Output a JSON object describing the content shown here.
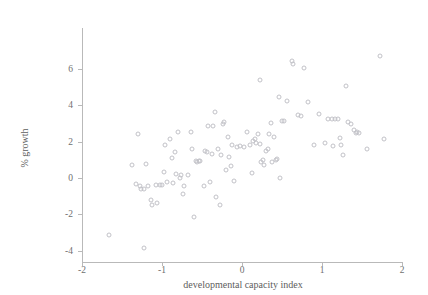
{
  "chart_data": {
    "type": "scatter",
    "title": "",
    "xlabel": "developmental capacity index",
    "ylabel": "% growth",
    "xlim": [
      -2,
      2
    ],
    "ylim": [
      -4.4,
      7.0
    ],
    "xticks": [
      -2,
      -1,
      0,
      1,
      2
    ],
    "xtick_labels": [
      "-2",
      "-1",
      "0",
      "1",
      "2"
    ],
    "yticks": [
      -4,
      -2,
      0,
      2,
      4,
      6
    ],
    "ytick_labels": [
      "-4",
      "-2",
      "0",
      "2",
      "4",
      "6"
    ],
    "grid": false,
    "legend": null,
    "marker": "open-circle",
    "marker_color": "#c2c2c8",
    "points": [
      [
        -1.66,
        -3.12
      ],
      [
        -1.22,
        -3.85
      ],
      [
        -1.38,
        0.72
      ],
      [
        -1.3,
        2.42
      ],
      [
        -1.33,
        -0.32
      ],
      [
        -1.28,
        -0.42
      ],
      [
        -1.26,
        -0.58
      ],
      [
        -1.22,
        -0.6
      ],
      [
        -1.2,
        0.78
      ],
      [
        -1.18,
        -0.46
      ],
      [
        -1.14,
        -1.22
      ],
      [
        -1.12,
        -1.48
      ],
      [
        -1.08,
        -0.4
      ],
      [
        -1.06,
        -1.4
      ],
      [
        -1.02,
        -0.38
      ],
      [
        -1.0,
        -0.4
      ],
      [
        -0.98,
        0.32
      ],
      [
        -0.96,
        1.82
      ],
      [
        -0.94,
        -0.22
      ],
      [
        -0.9,
        2.12
      ],
      [
        -0.88,
        1.08
      ],
      [
        -0.86,
        -0.3
      ],
      [
        -0.84,
        1.44
      ],
      [
        -0.82,
        0.22
      ],
      [
        -0.8,
        2.52
      ],
      [
        -0.78,
        -0.02
      ],
      [
        -0.76,
        0.16
      ],
      [
        -0.74,
        -0.88
      ],
      [
        -0.72,
        -0.46
      ],
      [
        -0.68,
        0.14
      ],
      [
        -0.64,
        2.54
      ],
      [
        -0.62,
        1.62
      ],
      [
        -0.6,
        -2.12
      ],
      [
        -0.58,
        0.92
      ],
      [
        -0.56,
        0.88
      ],
      [
        -0.54,
        0.96
      ],
      [
        -0.52,
        0.92
      ],
      [
        -0.48,
        -0.44
      ],
      [
        -0.46,
        1.5
      ],
      [
        -0.44,
        1.42
      ],
      [
        -0.42,
        2.86
      ],
      [
        -0.4,
        -0.2
      ],
      [
        -0.38,
        1.34
      ],
      [
        -0.36,
        2.88
      ],
      [
        -0.34,
        3.64
      ],
      [
        -0.32,
        -1.04
      ],
      [
        -0.3,
        1.58
      ],
      [
        -0.28,
        -1.5
      ],
      [
        -0.26,
        1.26
      ],
      [
        -0.24,
        2.98
      ],
      [
        -0.22,
        3.06
      ],
      [
        -0.2,
        0.46
      ],
      [
        -0.18,
        2.28
      ],
      [
        -0.16,
        1.18
      ],
      [
        -0.14,
        0.68
      ],
      [
        -0.12,
        1.8
      ],
      [
        -0.1,
        -0.18
      ],
      [
        -0.06,
        1.7
      ],
      [
        -0.02,
        1.74
      ],
      [
        0.02,
        1.68
      ],
      [
        0.06,
        2.54
      ],
      [
        0.1,
        1.84
      ],
      [
        0.12,
        0.26
      ],
      [
        0.14,
        2.06
      ],
      [
        0.16,
        2.14
      ],
      [
        0.18,
        1.92
      ],
      [
        0.2,
        2.4
      ],
      [
        0.22,
        1.88
      ],
      [
        0.22,
        5.4
      ],
      [
        0.24,
        0.86
      ],
      [
        0.26,
        1.0
      ],
      [
        0.28,
        0.74
      ],
      [
        0.3,
        1.48
      ],
      [
        0.32,
        1.62
      ],
      [
        0.34,
        2.42
      ],
      [
        0.36,
        3.02
      ],
      [
        0.38,
        0.9
      ],
      [
        0.4,
        2.26
      ],
      [
        0.42,
        0.98
      ],
      [
        0.44,
        1.04
      ],
      [
        0.46,
        4.46
      ],
      [
        0.48,
        0.02
      ],
      [
        0.5,
        3.12
      ],
      [
        0.52,
        3.12
      ],
      [
        0.56,
        4.22
      ],
      [
        0.62,
        6.44
      ],
      [
        0.64,
        6.26
      ],
      [
        0.7,
        3.48
      ],
      [
        0.74,
        3.38
      ],
      [
        0.78,
        6.04
      ],
      [
        0.82,
        4.16
      ],
      [
        0.9,
        1.8
      ],
      [
        0.96,
        3.5
      ],
      [
        1.04,
        1.94
      ],
      [
        1.08,
        3.24
      ],
      [
        1.12,
        3.22
      ],
      [
        1.14,
        1.74
      ],
      [
        1.16,
        3.24
      ],
      [
        1.2,
        3.24
      ],
      [
        1.22,
        2.22
      ],
      [
        1.24,
        1.82
      ],
      [
        1.26,
        1.26
      ],
      [
        1.3,
        5.06
      ],
      [
        1.32,
        3.1
      ],
      [
        1.36,
        2.96
      ],
      [
        1.4,
        2.62
      ],
      [
        1.42,
        2.5
      ],
      [
        1.44,
        2.54
      ],
      [
        1.46,
        2.48
      ],
      [
        1.56,
        1.62
      ],
      [
        1.72,
        6.72
      ],
      [
        1.78,
        2.14
      ]
    ],
    "n_points": 113
  },
  "axes": {
    "x_title": "developmental capacity index",
    "y_title": "% growth"
  }
}
